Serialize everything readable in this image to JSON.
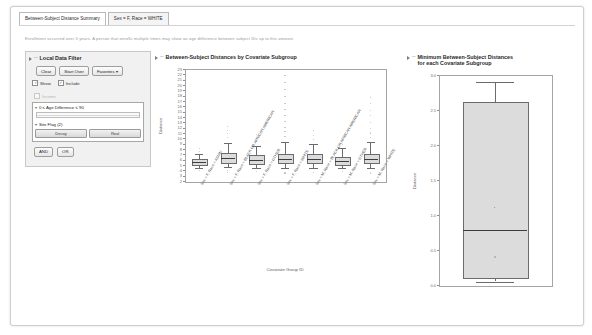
{
  "window": {
    "tabs": [
      {
        "label": "Between-Subject Distance Summary",
        "active": true
      },
      {
        "label": "Sex = F, Race = WHITE",
        "active": false
      }
    ],
    "note": "Enrollment occurred over 5 years. A person that enrolls multiple times may show an age difference between subject IDs up to this amount."
  },
  "filter": {
    "title": "Local Data Filter",
    "buttons": {
      "clear": "Clear",
      "start_over": "Start Over",
      "favorites": "Favorites ▾"
    },
    "checkboxes": [
      {
        "label": "Show",
        "checked": true
      },
      {
        "label": "Include",
        "checked": true
      }
    ],
    "disabled_item": "Income",
    "range_filter": {
      "label": "0 ≤ Age Difference ≤ 90"
    },
    "categorical_filter": {
      "label": "Site Flag (2)",
      "values": [
        "Decoy",
        "Real"
      ]
    },
    "logic": {
      "and": "AND",
      "or": "OR"
    }
  },
  "chart_data": [
    {
      "panel_id": "main",
      "type": "box",
      "title": "Between-Subject Distances by Covariate Subgroup",
      "xlabel": "Covariate Group ID",
      "ylabel": "Distance",
      "ylim": [
        2,
        23
      ],
      "yticks": [
        2,
        3,
        4,
        5,
        6,
        7,
        8,
        9,
        10,
        11,
        12,
        13,
        14,
        15,
        16,
        17,
        18,
        19,
        20,
        21,
        22,
        23
      ],
      "grid": false,
      "legend": "none",
      "categories": [
        "Sex = F, Race = ASIAN",
        "Sex = F, Race = BLACK OR AFRICAN AMERICAN",
        "Sex = F, Race = OTHER",
        "Sex = F, Race = WHITE",
        "Sex = M, Race = BLACK OR AFRICAN AMERICAN",
        "Sex = M, Race = OTHER",
        "Sex = M, Race = WHITE"
      ],
      "boxes": [
        {
          "category": "Sex = F, Race = ASIAN",
          "min": 4.4,
          "q1": 5.1,
          "median": 5.6,
          "q3": 6.1,
          "max": 7.0,
          "outliers": [
            3.9,
            7.6,
            8.1
          ]
        },
        {
          "category": "Sex = F, Race = BLACK OR AFRICAN AMERICAN",
          "min": 4.6,
          "q1": 5.6,
          "median": 6.3,
          "q3": 7.2,
          "max": 9.2,
          "outliers": [
            3.6,
            3.9,
            10.2,
            10.9,
            11.5,
            12.3
          ]
        },
        {
          "category": "Sex = F, Race = OTHER",
          "min": 4.5,
          "q1": 5.4,
          "median": 6.0,
          "q3": 6.8,
          "max": 8.6,
          "outliers": [
            3.7,
            9.4,
            10.0,
            10.8
          ]
        },
        {
          "category": "Sex = F, Race = WHITE",
          "min": 4.4,
          "q1": 5.5,
          "median": 6.2,
          "q3": 7.1,
          "max": 9.4,
          "outliers": [
            3.5,
            10.4,
            11.2,
            12.0,
            13.1,
            14.3,
            15.4,
            16.6,
            17.8,
            19.1,
            20.4,
            21.8
          ]
        },
        {
          "category": "Sex = M, Race = BLACK OR AFRICAN AMERICAN",
          "min": 4.5,
          "q1": 5.5,
          "median": 6.1,
          "q3": 7.0,
          "max": 9.0,
          "outliers": [
            3.6,
            9.8,
            10.5,
            11.4
          ]
        },
        {
          "category": "Sex = M, Race = OTHER",
          "min": 4.4,
          "q1": 5.2,
          "median": 5.8,
          "q3": 6.5,
          "max": 8.2,
          "outliers": [
            3.8,
            8.9,
            9.6
          ]
        },
        {
          "category": "Sex = M, Race = WHITE",
          "min": 4.4,
          "q1": 5.5,
          "median": 6.2,
          "q3": 7.1,
          "max": 9.3,
          "outliers": [
            3.5,
            10.1,
            11.0,
            11.9,
            13.0,
            14.2,
            15.3,
            16.5,
            17.6
          ]
        }
      ]
    },
    {
      "panel_id": "min",
      "type": "box",
      "title_line1": "Minimum Between-Subject Distances",
      "title_line2": "for each Covariate Subgroup",
      "xlabel": "",
      "ylabel": "Distance",
      "ylim": [
        0.0,
        3.0
      ],
      "yticks": [
        0.0,
        0.5,
        1.0,
        1.5,
        2.0,
        2.5,
        3.0
      ],
      "ytick_labels": [
        "0.0",
        "0.5",
        "1.0",
        "1.5",
        "2.0",
        "2.5",
        "3.0"
      ],
      "grid": false,
      "legend": "none",
      "boxes": [
        {
          "category": "All subgroups",
          "min": 0.05,
          "q1": 0.12,
          "median": 0.78,
          "q3": 2.62,
          "max": 2.9,
          "mean": 1.1,
          "outliers": [
            0.4
          ]
        }
      ]
    }
  ]
}
